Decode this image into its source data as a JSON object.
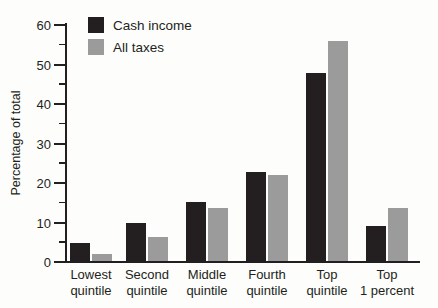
{
  "chart_data": {
    "type": "bar",
    "title": "",
    "xlabel": "",
    "ylabel": "Percentage of total",
    "ylim": [
      0,
      60
    ],
    "y_major_ticks": [
      0,
      10,
      20,
      30,
      40,
      50,
      60
    ],
    "y_minor_tick_step": 5,
    "grid": false,
    "legend_position": "top-left-inside",
    "categories": [
      "Lowest quintile",
      "Second quintile",
      "Middle quintile",
      "Fourth quintile",
      "Top quintile",
      "Top 1 percent"
    ],
    "series": [
      {
        "name": "Cash income",
        "color": "#231f20",
        "values": [
          4.5,
          9.7,
          15.0,
          22.5,
          47.5,
          8.8
        ]
      },
      {
        "name": "All taxes",
        "color": "#9b9b9b",
        "values": [
          1.8,
          6.2,
          13.4,
          21.9,
          55.7,
          13.5
        ]
      }
    ]
  }
}
